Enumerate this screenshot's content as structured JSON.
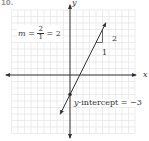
{
  "figure_label": "10.",
  "axes": {
    "x_label": "x",
    "y_label": "y"
  },
  "slope_annotation": {
    "prefix": "m =",
    "numerator": "2",
    "denominator": "1",
    "result": "= 2"
  },
  "rise_label": "2",
  "run_label": "1",
  "intercept_annotation": {
    "var": "y",
    "text": "-intercept = −3"
  },
  "chart_data": {
    "type": "line",
    "title": "",
    "xlabel": "x",
    "ylabel": "y",
    "grid": true,
    "xlim": [
      -9,
      10
    ],
    "ylim": [
      -9,
      10
    ],
    "series": [
      {
        "name": "y = 2x − 3",
        "slope": 2,
        "intercept": -3,
        "x": [
          -1.5,
          5.5
        ],
        "y": [
          -6,
          8
        ]
      }
    ],
    "annotations": [
      {
        "text": "m = 2/1 = 2",
        "position": "top-left"
      },
      {
        "text": "rise 2, run 1",
        "at": [
          4,
          5
        ]
      },
      {
        "text": "y-intercept = −3",
        "point": [
          0,
          -3
        ]
      }
    ],
    "colors": {
      "line": "#333333",
      "grid": "#e4e4e4",
      "axis": "#333333"
    }
  }
}
